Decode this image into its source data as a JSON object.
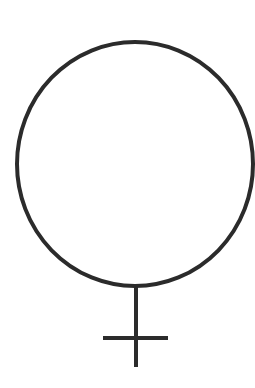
{
  "symbol": {
    "icon": "female-symbol",
    "stroke_color": "#2b2b2b",
    "background_color": "#ffffff"
  }
}
